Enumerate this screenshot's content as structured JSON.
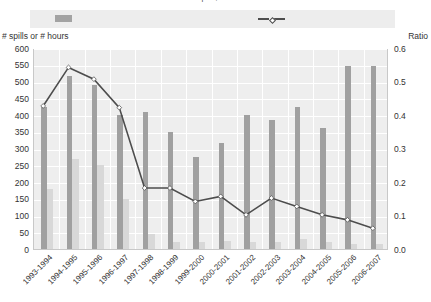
{
  "header": {
    "title_cut": "Number of spills, hours and ratio",
    "legend": {
      "bar_swatch_name": "bar-series-swatch",
      "line_swatch_name": "line-series-swatch",
      "bar_label": "",
      "line_label": ""
    }
  },
  "colors": {
    "bar_primary": "#a0a0a0",
    "bar_secondary": "#d8d8d8",
    "line": "#4d4d4d",
    "marker_fill": "#ffffff",
    "plot_background": "#eeeeee",
    "gridline": "#ffffff",
    "legend_band": "#ededed",
    "text": "#333333"
  },
  "chart_data": {
    "type": "bar",
    "title": "",
    "xlabel": "",
    "ylabel": "# spills or # hours",
    "y2label": "Ratio",
    "ylim": [
      0,
      600
    ],
    "y2lim": [
      0,
      0.6
    ],
    "yticks": [
      0,
      50,
      100,
      150,
      200,
      250,
      300,
      350,
      400,
      450,
      500,
      550,
      600
    ],
    "ytick_labels": [
      "0",
      "50",
      "100",
      "150",
      "200",
      "250",
      "300",
      "350",
      "400",
      "450",
      "500",
      "550",
      "600"
    ],
    "y2ticks": [
      0.0,
      0.1,
      0.2,
      0.3,
      0.4,
      0.5,
      0.6
    ],
    "y2tick_labels": [
      "0.0",
      "0.1",
      "0.2",
      "0.3",
      "0.4",
      "0.5",
      "0.6"
    ],
    "grid": true,
    "legend_position": "top",
    "categories": [
      "1993-1994",
      "1994-1995",
      "1995-1996",
      "1996-1997",
      "1997-1998",
      "1998-1999",
      "1999-2000",
      "2000-2001",
      "2001-2002",
      "2002-2003",
      "2003-2004",
      "2004-2005",
      "2005-2006",
      "2006-2007"
    ],
    "series": [
      {
        "name": "# spills",
        "kind": "bar",
        "axis": "left",
        "color": "#a0a0a0",
        "values": [
          425,
          515,
          490,
          400,
          410,
          350,
          275,
          315,
          400,
          385,
          425,
          360,
          545,
          545
        ]
      },
      {
        "name": "# hours",
        "kind": "bar",
        "axis": "left",
        "color": "#d8d8d8",
        "values": [
          180,
          270,
          250,
          150,
          45,
          20,
          20,
          25,
          20,
          20,
          30,
          20,
          15,
          15
        ]
      },
      {
        "name": "Ratio",
        "kind": "line",
        "axis": "right",
        "color": "#4d4d4d",
        "dashed": true,
        "values": [
          0.43,
          0.545,
          0.51,
          0.425,
          0.185,
          0.185,
          0.145,
          0.16,
          0.105,
          0.155,
          0.13,
          0.105,
          0.09,
          0.065
        ]
      }
    ]
  }
}
